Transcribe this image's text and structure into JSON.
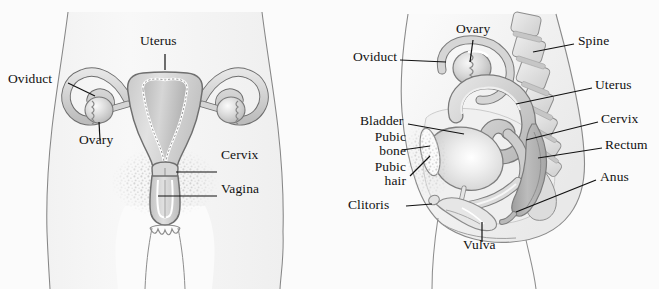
{
  "figure": {
    "background_color": "#fbfbfb",
    "ink_color": "#111111",
    "panels": [
      {
        "id": "anterior",
        "name": "Anterior (frontal) view"
      },
      {
        "id": "sagittal",
        "name": "Sagittal (side) view"
      }
    ]
  },
  "anterior": {
    "labels": {
      "oviduct": "Oviduct",
      "uterus": "Uterus",
      "ovary": "Ovary",
      "cervix": "Cervix",
      "vagina": "Vagina"
    }
  },
  "sagittal": {
    "labels": {
      "ovary": "Ovary",
      "oviduct": "Oviduct",
      "spine": "Spine",
      "uterus": "Uterus",
      "cervix": "Cervix",
      "bladder": "Bladder",
      "rectum": "Rectum",
      "pubic_bone": "Pubic\nbone",
      "pubic_bone_line1": "Pubic",
      "pubic_bone_line2": "bone",
      "pubic_hair_line1": "Pubic",
      "pubic_hair_line2": "hair",
      "anus": "Anus",
      "clitoris": "Clitoris",
      "vulva": "Vulva"
    }
  },
  "colors": {
    "outline": "#5a5a5a",
    "organ_fill_light": "#e4e4e4",
    "organ_fill_mid": "#d2d2d2",
    "organ_fill_dark": "#b4b4b4",
    "organ_fill_darker": "#a0a0a0",
    "body_fill": "#f4f4f4",
    "highlight": "#ffffff",
    "bone_fill": "#dedede",
    "hair_stipple": "#c9c9c9"
  }
}
